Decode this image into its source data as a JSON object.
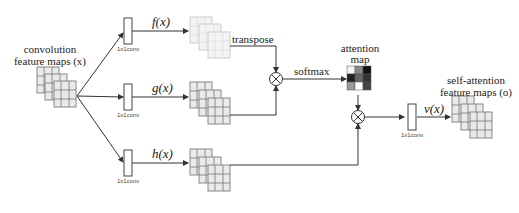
{
  "input": {
    "label_line1": "convolution",
    "label_line2": "feature maps (x)"
  },
  "branches": {
    "f": {
      "conv_label": "1x1conv",
      "fn_label": "f(x)"
    },
    "g": {
      "conv_label": "1x1conv",
      "fn_label": "g(x)"
    },
    "h": {
      "conv_label": "1x1conv",
      "fn_label": "h(x)"
    }
  },
  "ops": {
    "transpose_label": "transpose",
    "softmax_label": "softmax",
    "multiply_symbol": "⊗"
  },
  "attention": {
    "label_line1": "attention",
    "label_line2": "map",
    "cells": [
      "#f4f4f4",
      "#888888",
      "#111111",
      "#222222",
      "#666666",
      "#333333",
      "#999999",
      "#ffffff",
      "#444444"
    ]
  },
  "output": {
    "conv_label": "1x1conv",
    "fn_label": "v(x)",
    "label_line1": "self-attention",
    "label_line2": "feature maps (o)"
  },
  "colors": {
    "line": "#333333",
    "map_fill": "#e8e8e8",
    "map_border": "#777777"
  }
}
